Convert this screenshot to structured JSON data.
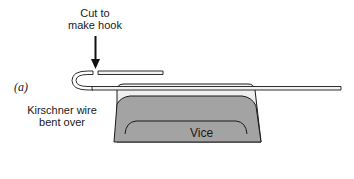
{
  "figure": {
    "panel_label": "(a)",
    "labels": {
      "cut_line1": "Cut to",
      "cut_line2": "make hook",
      "wire_line1": "Kirschner wire",
      "wire_line2": "bent over",
      "vice": "Vice"
    },
    "colors": {
      "vice_top": "#e4e4e4",
      "vice_body": "#9e9e9e",
      "outline": "#1a1a1a",
      "wire_fill": "#f2f2f2"
    }
  }
}
